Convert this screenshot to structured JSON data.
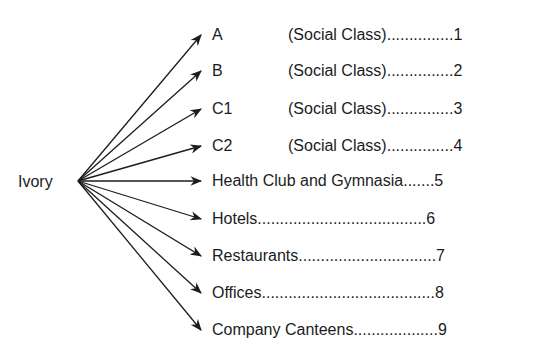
{
  "diagram": {
    "root": {
      "label": "Ivory",
      "x": 78,
      "y": 181
    },
    "stroke_color": "#1c1c1c",
    "items": [
      {
        "code": "A",
        "text": "(Social Class)...............",
        "number": "1",
        "y": 35
      },
      {
        "code": "B",
        "text": "(Social Class)...............",
        "number": "2",
        "y": 71
      },
      {
        "code": "C1",
        "text": "(Social Class)...............",
        "number": "3",
        "y": 109
      },
      {
        "code": "C2",
        "text": "(Social Class)...............",
        "number": "4",
        "y": 146
      },
      {
        "code": "",
        "text": "Health Club and Gymnasia.......",
        "number": "5",
        "y": 181
      },
      {
        "code": "",
        "text": "Hotels......................................",
        "number": "6",
        "y": 219
      },
      {
        "code": "",
        "text": "Restaurants...............................",
        "number": "7",
        "y": 256
      },
      {
        "code": "",
        "text": "Offices.......................................",
        "number": "8",
        "y": 293
      },
      {
        "code": "",
        "text": "Company Canteens...................",
        "number": "9",
        "y": 330
      }
    ]
  }
}
